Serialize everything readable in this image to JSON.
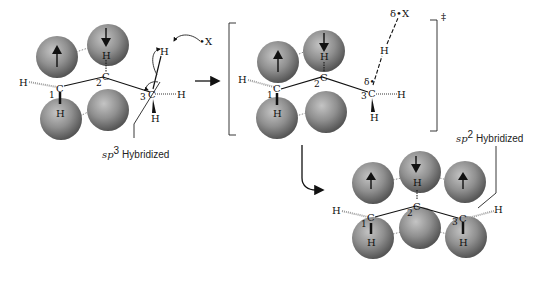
{
  "colors": {
    "sphere_light": "#b5b5b5",
    "sphere_mid": "#8e8e8e",
    "sphere_dark": "#5a5a5a",
    "ink": "#111111"
  },
  "reactant": {
    "atoms": {
      "c1": "C",
      "c2": "C",
      "c3": "C",
      "num1": "1",
      "num2": "2",
      "num3": "3",
      "h_left": "H",
      "h_c1_down": "H",
      "h_c2_up": "H",
      "h_c3_right": "H",
      "h_c3_down": "H",
      "h_c3_top": "H",
      "x_radical": "•X"
    },
    "label_italic": "sp",
    "label_sup": "3",
    "label_text": "Hybridized"
  },
  "transition_state": {
    "atoms": {
      "c1": "C",
      "c2": "C",
      "c3": "C",
      "num1": "1",
      "num2": "2",
      "num3": "3",
      "h_left": "H",
      "h_c1_down": "H",
      "h_c2_up": "H",
      "h_c3_right": "H",
      "h_c3_down": "H",
      "h_transfer": "H",
      "delta_c3": "δ•",
      "delta_x": "δ•X"
    },
    "double_dagger": "‡"
  },
  "product": {
    "atoms": {
      "c1": "C",
      "c2": "C",
      "c3": "C",
      "num1": "1",
      "num2": "2",
      "num3": "3",
      "h_left": "H",
      "h_right": "H",
      "h_c1_down": "H",
      "h_c2_up": "H",
      "h_c3_down": "H"
    },
    "label_italic": "sp",
    "label_sup": "2",
    "label_text": "Hybridized"
  },
  "spin_arrows": {
    "up": "up-arrow",
    "down": "down-arrow"
  }
}
